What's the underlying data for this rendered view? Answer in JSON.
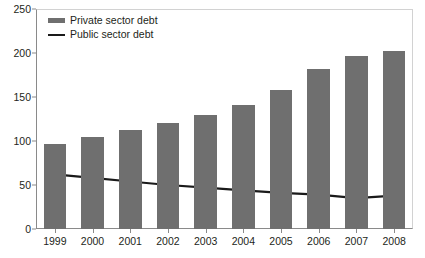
{
  "chart_data": {
    "type": "bar",
    "title": "",
    "subtitle": "",
    "xlabel": "",
    "ylabel": "",
    "categories": [
      "1999",
      "2000",
      "2001",
      "2002",
      "2003",
      "2004",
      "2005",
      "2006",
      "2007",
      "2008"
    ],
    "ylim": [
      0,
      250
    ],
    "yticks": [
      0,
      50,
      100,
      150,
      200,
      250
    ],
    "ytick_labels": [
      "0",
      "50",
      "100",
      "150",
      "200",
      "250"
    ],
    "grid": false,
    "legend_position": "top-left",
    "series": [
      {
        "name": "Private sector debt",
        "type": "bar",
        "color": "#6f6f6f",
        "values": [
          97,
          105,
          113,
          120,
          130,
          141,
          158,
          182,
          197,
          202
        ]
      },
      {
        "name": "Public sector debt",
        "type": "line",
        "color": "#1a1a1a",
        "values": [
          62,
          58,
          54,
          50,
          47,
          44,
          41,
          39,
          35,
          38
        ]
      }
    ]
  },
  "legend": {
    "items": [
      {
        "label": "Private sector debt",
        "marker": "bar-swatch-icon"
      },
      {
        "label": "Public sector debt",
        "marker": "line-swatch-icon"
      }
    ]
  },
  "axes": {
    "y_tick_labels": [
      "250",
      "200",
      "150",
      "100",
      "50",
      "0"
    ],
    "x_tick_labels": [
      "1999",
      "2000",
      "2001",
      "2002",
      "2003",
      "2004",
      "2005",
      "2006",
      "2007",
      "2008"
    ]
  },
  "colors": {
    "bar": "#6f6f6f",
    "line": "#1a1a1a",
    "axis": "#8a8a8a",
    "frame": "#d2d2d2",
    "text": "#231f20",
    "background": "#ffffff"
  }
}
